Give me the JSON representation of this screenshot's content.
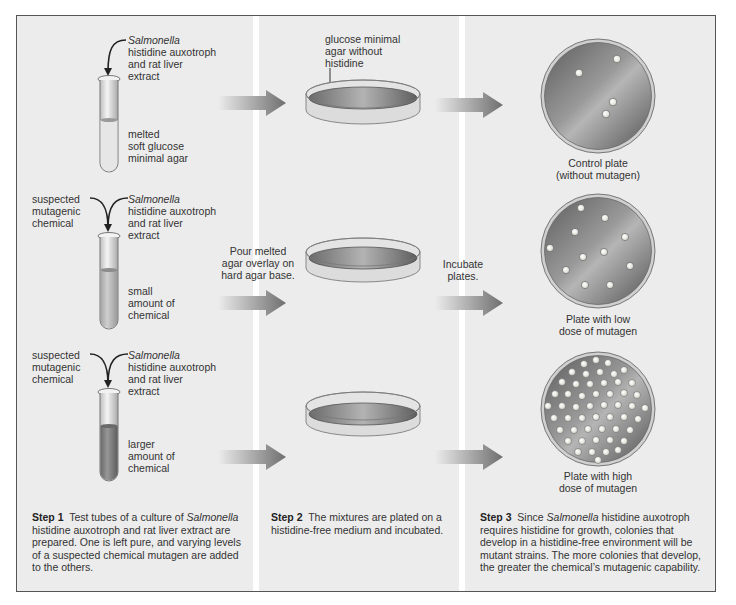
{
  "diagram": {
    "colors": {
      "panel_bg": "#ececec",
      "frame": "#555555",
      "arrow_light": "#e4e4e4",
      "arrow_dark": "#6e6e6e",
      "agar_dark": "#6a6a6a",
      "colony": "#f4f4ee"
    },
    "column1": {
      "tube1": {
        "input_label_italic": "Salmonella",
        "input_label_rest": [
          "histidine auxotroph",
          "and rat liver",
          "extract"
        ],
        "contents_label": [
          "melted",
          "soft glucose",
          "minimal agar"
        ],
        "fill_level": "clear"
      },
      "tube2": {
        "left_label": [
          "suspected",
          "mutagenic",
          "chemical"
        ],
        "input_label_italic": "Salmonella",
        "input_label_rest": [
          "histidine auxotroph",
          "and rat liver",
          "extract"
        ],
        "contents_label": [
          "small",
          "amount of",
          "chemical"
        ],
        "fill_level": "light"
      },
      "tube3": {
        "left_label": [
          "suspected",
          "mutagenic",
          "chemical"
        ],
        "input_label_italic": "Salmonella",
        "input_label_rest": [
          "histidine auxotroph",
          "and rat liver",
          "extract"
        ],
        "contents_label": [
          "larger",
          "amount of",
          "chemical"
        ],
        "fill_level": "dark"
      },
      "step": {
        "heading": "Step 1",
        "text_before_italic": "Test tubes of a culture of",
        "italic": "Salmonella",
        "text_after_italic": "histidine auxotroph and rat liver extract are prepared. One is left pure, and varying levels of a suspected chemical mutagen are added to the others."
      }
    },
    "column2": {
      "plate_label": [
        "glucose minimal",
        "agar without",
        "histidine"
      ],
      "arrow_label": [
        "Pour melted",
        "agar overlay on",
        "hard agar base."
      ],
      "step": {
        "heading": "Step 2",
        "text": "The mixtures are plated on a histidine-free medium and incubated."
      }
    },
    "column3": {
      "arrow_label": [
        "Incubate",
        "plates."
      ],
      "plates": [
        {
          "caption": [
            "Control plate",
            "(without mutagen)"
          ],
          "colony_count": 4
        },
        {
          "caption": [
            "Plate with low",
            "dose of mutagen"
          ],
          "colony_count": 12
        },
        {
          "caption": [
            "Plate with high",
            "dose of mutagen"
          ],
          "colony_count": 70
        }
      ],
      "step": {
        "heading": "Step 3",
        "text_before_italic": "Since",
        "italic": "Salmonella",
        "text_after_italic": "histidine auxotroph requires histidine for growth, colonies that develop in a histidine-free environment will be mutant strains. The more colonies that develop, the greater the chemical’s mutagenic capability."
      }
    }
  }
}
